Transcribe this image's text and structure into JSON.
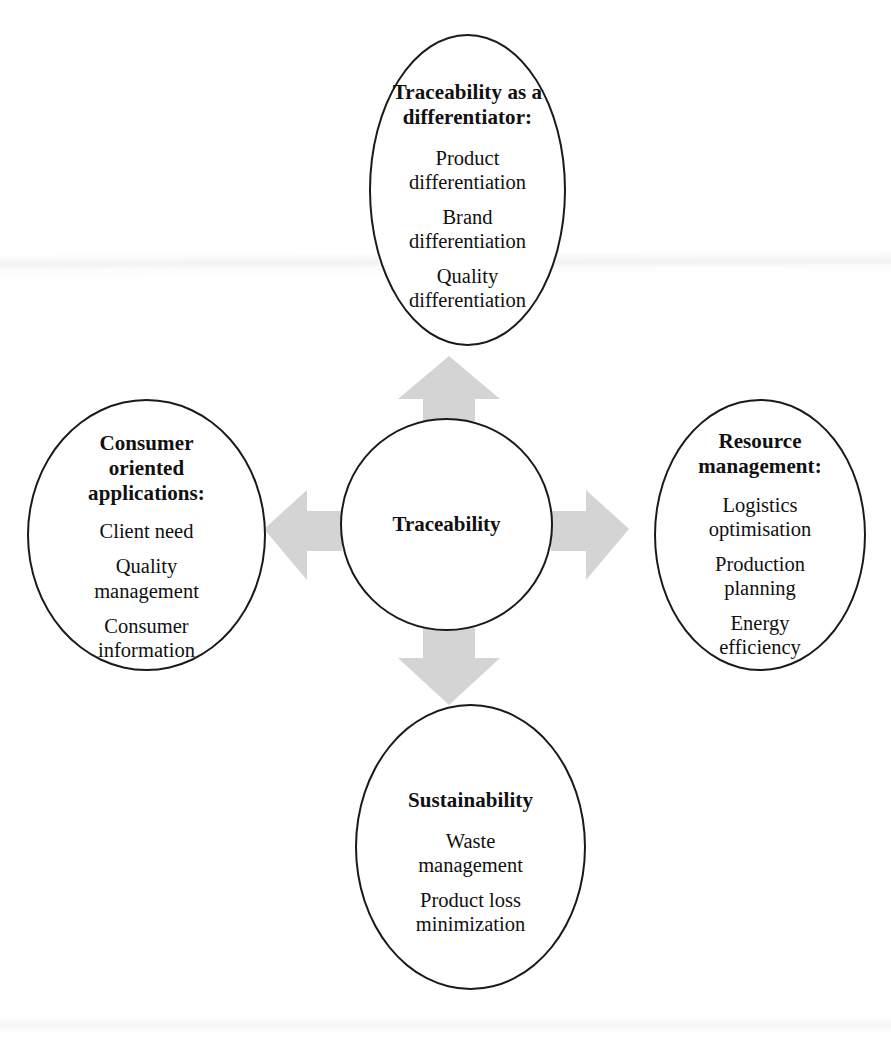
{
  "diagram": {
    "type": "radial-cross-diagram",
    "background_color": "#ffffff",
    "outline_color": "#1a1a1a",
    "arrow_color": "#d4d4d4",
    "hub": {
      "label": "Traceability"
    },
    "nodes": [
      {
        "position": "top",
        "title": "Traceability as a\ndifferentiator:",
        "items": [
          "Product\ndifferentiation",
          "Brand\ndifferentiation",
          "Quality\ndifferentiation"
        ]
      },
      {
        "position": "left",
        "title": "Consumer\noriented\napplications:",
        "items": [
          "Client need",
          "Quality\nmanagement",
          "Consumer\ninformation"
        ]
      },
      {
        "position": "right",
        "title": "Resource\nmanagement:",
        "items": [
          "Logistics\noptimisation",
          "Production\nplanning",
          "Energy\nefficiency"
        ]
      },
      {
        "position": "bottom",
        "title": "Sustainability",
        "items": [
          "Waste\nmanagement",
          "Product loss\nminimization"
        ]
      }
    ],
    "arrows": [
      {
        "name": "arrow-up",
        "direction": "up",
        "from": "Traceability",
        "to": "Traceability as a differentiator:"
      },
      {
        "name": "arrow-left",
        "direction": "left",
        "from": "Traceability",
        "to": "Consumer oriented applications:"
      },
      {
        "name": "arrow-right",
        "direction": "right",
        "from": "Traceability",
        "to": "Resource management:"
      },
      {
        "name": "arrow-down",
        "direction": "down",
        "from": "Traceability",
        "to": "Sustainability"
      }
    ]
  }
}
